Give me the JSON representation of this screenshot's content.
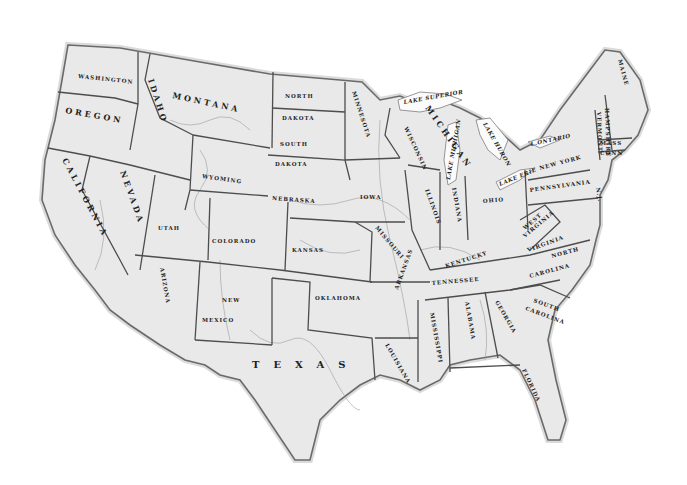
{
  "map": {
    "style": "vintage engraved grayscale",
    "background": "#ffffff",
    "land_color": "#e9e9e9",
    "border_color": "#4d4d4d",
    "states": {
      "washington": "WASHINGTON",
      "oregon": "OREGON",
      "california": "CALIFORNIA",
      "idaho": "IDAHO",
      "nevada": "NEVADA",
      "montana": "MONTANA",
      "wyoming": "WYOMING",
      "utah": "UTAH",
      "arizona": "ARIZONA",
      "colorado": "COLORADO",
      "new_mexico_1": "NEW",
      "new_mexico_2": "MEXICO",
      "north_dakota_1": "NORTH",
      "north_dakota_2": "DAKOTA",
      "south_dakota_1": "SOUTH",
      "south_dakota_2": "DAKOTA",
      "nebraska": "NEBRASKA",
      "kansas": "KANSAS",
      "oklahoma": "OKLAHOMA",
      "texas": "TEXAS",
      "minnesota": "MINNESOTA",
      "iowa": "IOWA",
      "missouri": "MISSOURI",
      "arkansas": "ARKANSAS",
      "louisiana": "LOUISIANA",
      "wisconsin": "WISCONSIN",
      "illinois": "ILLINOIS",
      "michigan": "MICHIGAN",
      "indiana": "INDIANA",
      "ohio": "OHIO",
      "kentucky": "KENTUCKY",
      "tennessee": "TENNESSEE",
      "mississippi": "MISSISSIPPI",
      "alabama": "ALABAMA",
      "georgia": "GEORGIA",
      "florida": "FLORIDA",
      "south_carolina_1": "SOUTH",
      "south_carolina_2": "CAROLINA",
      "north_carolina_1": "NORTH",
      "north_carolina_2": "CAROLINA",
      "virginia": "VIRGINIA",
      "west_virginia_1": "WEST",
      "west_virginia_2": "VIRGINIA",
      "pennsylvania": "PENNSYLVANIA",
      "new_york": "NEW YORK",
      "vermont": "VERMONT",
      "new_hampshire": "HAMPSHIRE",
      "maine": "MAINE",
      "massachusetts": "MASS",
      "connecticut": "CONN",
      "new_jersey": "N.J."
    },
    "lakes": {
      "superior": "LAKE SUPERIOR",
      "michigan": "LAKE MICHIGAN",
      "huron": "LAKE HURON",
      "erie": "LAKE ERIE",
      "ontario": "L.ONTARIO"
    }
  }
}
